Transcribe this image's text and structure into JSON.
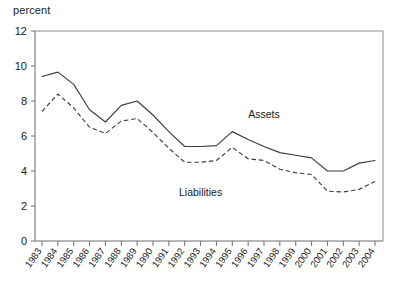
{
  "chart_data": {
    "type": "line",
    "title": "",
    "unit_label": "percent",
    "xlabel": "",
    "ylabel": "percent",
    "ylim": [
      0,
      12
    ],
    "yticks": [
      0,
      2,
      4,
      6,
      8,
      10,
      12
    ],
    "ytick_labels": [
      "0",
      "2",
      "4",
      "6",
      "8",
      "10",
      "12"
    ],
    "grid": false,
    "legend_position": "inline-annotation",
    "categories": [
      "1983",
      "1984",
      "1985",
      "1986",
      "1987",
      "1988",
      "1989",
      "1990",
      "1991",
      "1992",
      "1993",
      "1994",
      "1995",
      "1996",
      "1997",
      "1998",
      "1999",
      "2000",
      "2001",
      "2002",
      "2003",
      "2004"
    ],
    "series": [
      {
        "name": "Assets",
        "style": "solid",
        "color": "#3d3d3d",
        "annotation": "Assets",
        "values": [
          9.4,
          9.65,
          8.95,
          7.5,
          6.8,
          7.75,
          8.0,
          7.2,
          6.25,
          5.4,
          5.4,
          5.45,
          6.25,
          5.8,
          5.4,
          5.05,
          4.9,
          4.75,
          4.0,
          4.0,
          4.45,
          4.6
        ]
      },
      {
        "name": "Liabilities",
        "style": "dashed",
        "color": "#3d3d3d",
        "annotation": "Liabilities",
        "values": [
          7.4,
          8.4,
          7.6,
          6.5,
          6.15,
          6.85,
          7.0,
          6.2,
          5.3,
          4.5,
          4.5,
          4.6,
          5.35,
          4.7,
          4.6,
          4.1,
          3.9,
          3.8,
          2.85,
          2.8,
          2.95,
          3.4
        ]
      }
    ],
    "annotations": [
      {
        "text": "Assets",
        "x_year": "1997",
        "y_value": 7.05
      },
      {
        "text": "Liabilities",
        "x_year": "1993",
        "y_value": 2.55
      }
    ]
  }
}
